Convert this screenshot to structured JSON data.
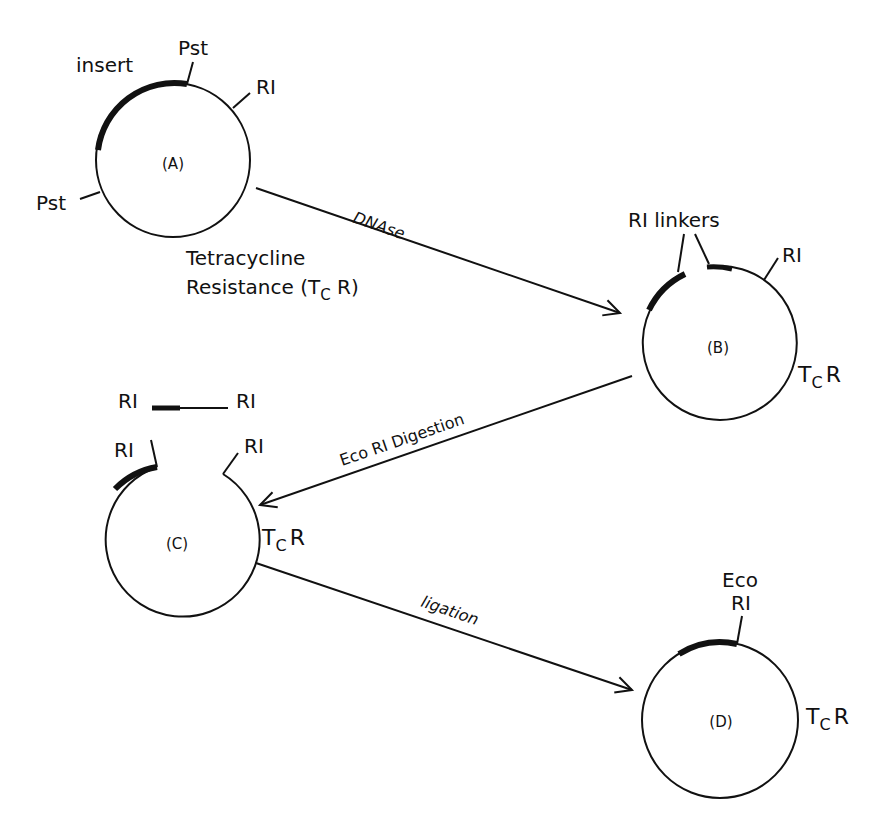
{
  "plasmids": {
    "A": {
      "label": "(A)",
      "pst_top": "Pst",
      "pst_left": "Pst",
      "insert": "insert",
      "ri": "RI",
      "tcr_line1": "Tetracycline",
      "tcr_line2": "Resistance (T",
      "tcr_sub": "C",
      "tcr_end": " R)"
    },
    "B": {
      "label": "(B)",
      "linkers": "RI linkers",
      "ri": "RI",
      "tc_T": "T",
      "tc_sub": "C",
      "tc_R": "R"
    },
    "C": {
      "label": "(C)",
      "fragment_left": "RI",
      "fragment_right": "RI",
      "ri_left": "RI",
      "ri_right": "RI",
      "tc_T": "T",
      "tc_sub": "C",
      "tc_R": "R"
    },
    "D": {
      "label": "(D)",
      "eco": "Eco",
      "ri": "RI",
      "tc_T": "T",
      "tc_sub": "C",
      "tc_R": "R"
    }
  },
  "steps": {
    "dnase": "DNAse",
    "digestion": "Eco RI  Digestion",
    "ligation": "ligation"
  }
}
